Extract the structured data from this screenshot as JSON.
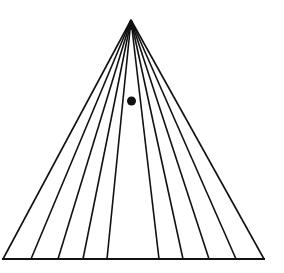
{
  "figure": {
    "type": "optical-illusion-diagram",
    "colors": {
      "background": "#ffffff",
      "stroke": "#111111",
      "dot": "#111111"
    },
    "apex": {
      "x": 131,
      "y": 20
    },
    "base_y": 259,
    "base_line": {
      "x1": 2,
      "x2": 265
    },
    "ray_base_x": [
      3,
      31,
      58,
      83,
      107,
      159,
      183,
      209,
      236,
      264
    ],
    "dot": {
      "cx": 131.5,
      "cy": 101,
      "r": 4.5
    }
  }
}
